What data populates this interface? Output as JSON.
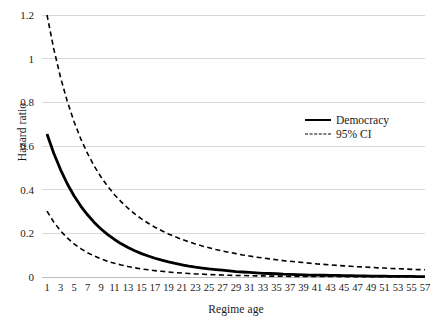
{
  "chart_data": {
    "type": "line",
    "title": "",
    "xlabel": "Regime age",
    "ylabel": "Hazard ratio",
    "xlim": [
      1,
      57
    ],
    "ylim": [
      0,
      1.2
    ],
    "grid": true,
    "grid_axis": "y",
    "legend_position": "top-right-inside",
    "x_tick_labels": [
      "1",
      "3",
      "5",
      "7",
      "9",
      "11",
      "13",
      "15",
      "17",
      "19",
      "21",
      "23",
      "25",
      "27",
      "29",
      "31",
      "33",
      "35",
      "37",
      "39",
      "41",
      "43",
      "45",
      "47",
      "49",
      "51",
      "53",
      "55",
      "57"
    ],
    "y_tick_labels": [
      "0",
      "0.2",
      "0.4",
      "0.6",
      "0.8",
      "1",
      "1.2"
    ],
    "y_ticks": [
      0,
      0.2,
      0.4,
      0.6,
      0.8,
      1,
      1.2
    ],
    "x": [
      1,
      2,
      3,
      4,
      5,
      6,
      7,
      8,
      9,
      10,
      11,
      12,
      13,
      14,
      15,
      16,
      17,
      18,
      19,
      20,
      21,
      22,
      23,
      24,
      25,
      26,
      27,
      28,
      29,
      30,
      31,
      32,
      33,
      34,
      35,
      36,
      37,
      38,
      39,
      40,
      41,
      42,
      43,
      44,
      45,
      46,
      47,
      48,
      49,
      50,
      51,
      52,
      53,
      54,
      55,
      56,
      57
    ],
    "series": [
      {
        "name": "Democracy",
        "style": "solid",
        "color": "#000000",
        "width": 2.8,
        "values": [
          0.655,
          0.567,
          0.492,
          0.427,
          0.372,
          0.325,
          0.285,
          0.25,
          0.22,
          0.194,
          0.172,
          0.152,
          0.135,
          0.12,
          0.107,
          0.096,
          0.086,
          0.077,
          0.069,
          0.062,
          0.056,
          0.05,
          0.045,
          0.041,
          0.037,
          0.034,
          0.031,
          0.028,
          0.025,
          0.023,
          0.021,
          0.019,
          0.017,
          0.016,
          0.015,
          0.013,
          0.012,
          0.011,
          0.01,
          0.009,
          0.009,
          0.008,
          0.007,
          0.007,
          0.006,
          0.006,
          0.005,
          0.005,
          0.004,
          0.004,
          0.004,
          0.003,
          0.003,
          0.003,
          0.003,
          0.002,
          0.002
        ]
      },
      {
        "name": "95% CI upper",
        "style": "dashed",
        "color": "#000000",
        "width": 1.6,
        "values": [
          1.2,
          1.045,
          0.915,
          0.805,
          0.712,
          0.633,
          0.566,
          0.508,
          0.458,
          0.415,
          0.377,
          0.344,
          0.315,
          0.289,
          0.266,
          0.246,
          0.228,
          0.212,
          0.197,
          0.184,
          0.172,
          0.161,
          0.151,
          0.142,
          0.134,
          0.126,
          0.119,
          0.113,
          0.107,
          0.101,
          0.096,
          0.091,
          0.087,
          0.083,
          0.079,
          0.075,
          0.072,
          0.069,
          0.066,
          0.063,
          0.06,
          0.058,
          0.055,
          0.053,
          0.051,
          0.049,
          0.047,
          0.046,
          0.044,
          0.042,
          0.041,
          0.039,
          0.038,
          0.037,
          0.035,
          0.034,
          0.033
        ]
      },
      {
        "name": "95% CI lower",
        "style": "dashed",
        "color": "#000000",
        "width": 1.6,
        "values": [
          0.302,
          0.252,
          0.212,
          0.179,
          0.152,
          0.13,
          0.111,
          0.096,
          0.083,
          0.072,
          0.063,
          0.055,
          0.048,
          0.042,
          0.037,
          0.033,
          0.029,
          0.026,
          0.023,
          0.02,
          0.018,
          0.016,
          0.014,
          0.013,
          0.011,
          0.01,
          0.009,
          0.008,
          0.007,
          0.007,
          0.006,
          0.005,
          0.005,
          0.004,
          0.004,
          0.004,
          0.003,
          0.003,
          0.003,
          0.002,
          0.002,
          0.002,
          0.002,
          0.002,
          0.001,
          0.001,
          0.001,
          0.001,
          0.001,
          0.001,
          0.001,
          0.001,
          0.001,
          0.001,
          0.001,
          0.001,
          0.001
        ]
      }
    ],
    "legend_entries": [
      {
        "label": "Democracy",
        "style": "solid"
      },
      {
        "label": "95% CI",
        "style": "dashed"
      }
    ]
  }
}
